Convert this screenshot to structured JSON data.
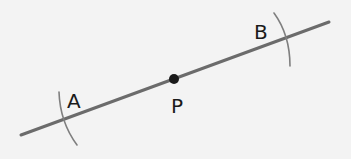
{
  "diagram": {
    "type": "geometric-construction",
    "colors": {
      "background": "#f3f3f3",
      "line": "#6b6b6b",
      "arc": "#7f7f7f",
      "point": "#1a1a1a",
      "label": "#1a1a1a"
    },
    "line": {
      "x1": 21,
      "y1": 135,
      "x2": 329,
      "y2": 22
    },
    "point_p": {
      "cx": 174,
      "cy": 79,
      "r": 5,
      "label": "P",
      "label_x": 171,
      "label_y": 113
    },
    "arcs": [
      {
        "name": "A",
        "path": "M 59 92 Q 60 122 77 145",
        "label": "A",
        "label_x": 67,
        "label_y": 108
      },
      {
        "name": "B",
        "path": "M 274 13 Q 290 35 290 66",
        "label": "B",
        "label_x": 254,
        "label_y": 39
      }
    ]
  }
}
